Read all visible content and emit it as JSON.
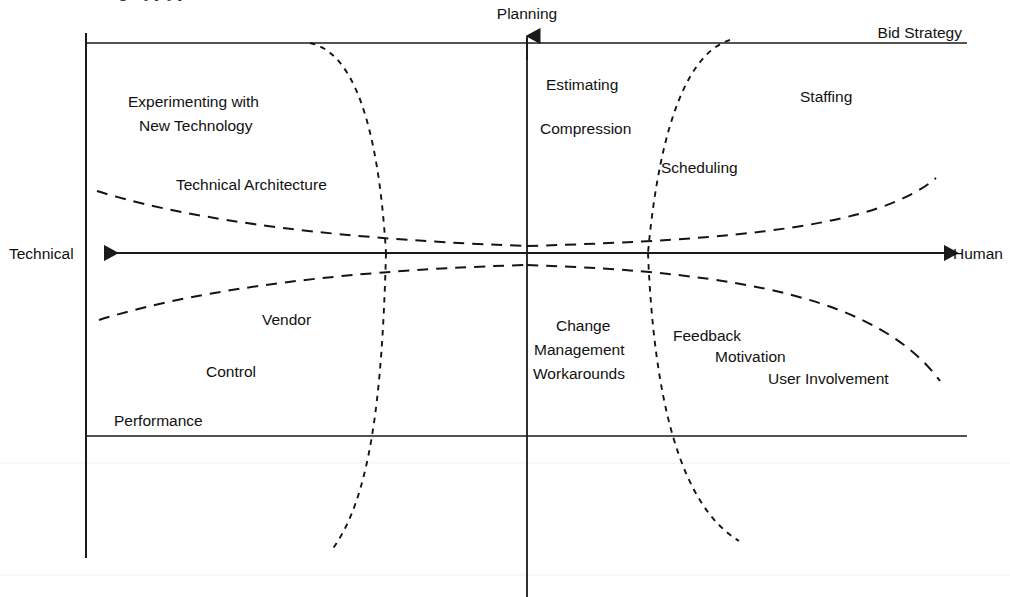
{
  "figure": {
    "clipped_title_fragment": "g  s  j  y  j  y",
    "background_color": "#ffffff",
    "ink_color": "#111111"
  },
  "axes": {
    "vertical_top_label": "Planning",
    "horizontal_left_label": "Technical",
    "horizontal_right_label": "Human",
    "top_right_label": "Bid Strategy"
  },
  "quadrants": {
    "upper_left": {
      "name": "technical-planning",
      "labels": [
        {
          "text": "Experimenting with",
          "x": 128,
          "y": 107
        },
        {
          "text": "New Technology",
          "x": 139,
          "y": 131
        },
        {
          "text": "Technical Architecture",
          "x": 176,
          "y": 190
        }
      ]
    },
    "upper_right": {
      "name": "human-planning",
      "labels": [
        {
          "text": "Estimating",
          "x": 546,
          "y": 90
        },
        {
          "text": "Compression",
          "x": 540,
          "y": 134
        },
        {
          "text": "Scheduling",
          "x": 661,
          "y": 173
        },
        {
          "text": "Staffing",
          "x": 800,
          "y": 102
        }
      ]
    },
    "lower_left": {
      "name": "technical-execution",
      "labels": [
        {
          "text": "Vendor",
          "x": 262,
          "y": 325
        },
        {
          "text": "Control",
          "x": 206,
          "y": 377
        },
        {
          "text": "Performance",
          "x": 114,
          "y": 426
        }
      ]
    },
    "lower_right": {
      "name": "human-execution",
      "labels": [
        {
          "text": "Change",
          "x": 556,
          "y": 331
        },
        {
          "text": "Management",
          "x": 534,
          "y": 355
        },
        {
          "text": "Workarounds",
          "x": 533,
          "y": 379
        },
        {
          "text": "Feedback",
          "x": 673,
          "y": 341
        },
        {
          "text": "Motivation",
          "x": 715,
          "y": 362
        },
        {
          "text": "User Involvement",
          "x": 768,
          "y": 384
        }
      ]
    }
  },
  "geometry": {
    "vertical_axis_x": 527,
    "horizontal_axis_y": 253,
    "left_border_x": 85,
    "top_rule_y": 43,
    "bottom_rule_y": 436,
    "right_rule_end_x": 967,
    "left_arrow_tip_x": 98,
    "right_arrow_tip_x": 950,
    "vertical_arrow_tip_y": 30,
    "left_border_bottom_y": 558,
    "vertical_axis_bottom_y": 597
  },
  "curves": [
    {
      "name": "upper-left-hyperbola-branch",
      "style": "long-dash",
      "path": "M 97 191 C 170 214, 300 238, 527 246"
    },
    {
      "name": "upper-right-hyperbola-branch",
      "style": "long-dash",
      "path": "M 527 246 C 740 240, 880 226, 936 178"
    },
    {
      "name": "lower-left-hyperbola-branch",
      "style": "long-dash",
      "path": "M 99 320 C 175 296, 310 271, 527 265"
    },
    {
      "name": "lower-right-hyperbola-branch",
      "style": "long-dash",
      "path": "M 527 265 C 745 272, 880 300, 940 381"
    },
    {
      "name": "left-vertical-hyperbola-upper",
      "style": "short-dash",
      "path": "M 310 43 C 352 52, 378 120, 386 253"
    },
    {
      "name": "left-vertical-hyperbola-lower",
      "style": "short-dash",
      "path": "M 386 253 C 382 400, 370 500, 331 551"
    },
    {
      "name": "right-vertical-hyperbola-upper",
      "style": "short-dash",
      "path": "M 730 40 C 690 52, 660 120, 648 253"
    },
    {
      "name": "right-vertical-hyperbola-lower",
      "style": "short-dash",
      "path": "M 648 253 C 654 400, 680 505, 739 541"
    }
  ]
}
